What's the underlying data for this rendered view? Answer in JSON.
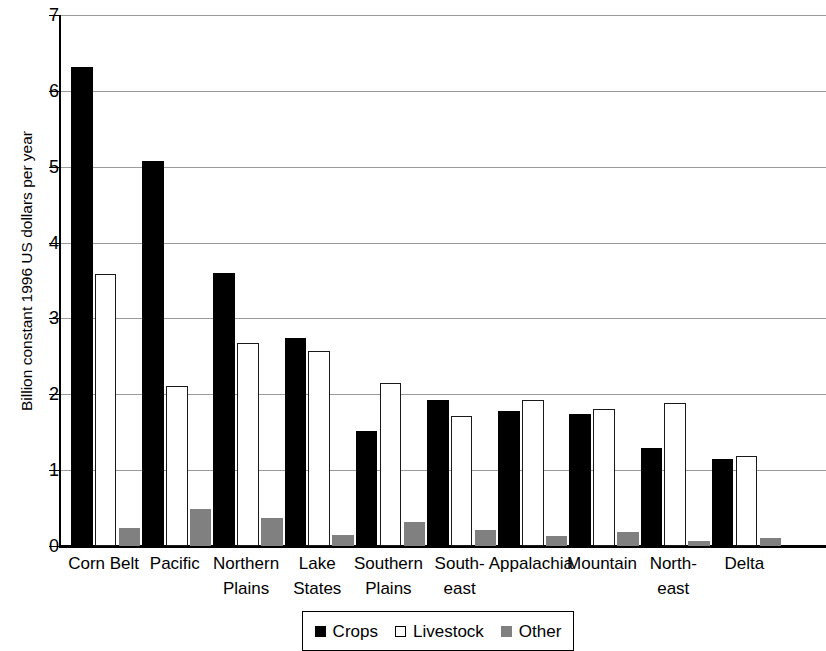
{
  "chart_data": {
    "type": "bar",
    "title": "",
    "xlabel": "",
    "ylabel": "Billion constant 1996 US dollars per year",
    "ylim": [
      0,
      7
    ],
    "yticks": [
      0,
      1,
      2,
      3,
      4,
      5,
      6,
      7
    ],
    "ytick_labels": [
      "0",
      "1",
      "2",
      "3",
      "4",
      "5",
      "6",
      "7"
    ],
    "grid": "horizontal",
    "legend_position": "bottom",
    "categories": [
      "Corn Belt",
      "Pacific",
      "Northern\nPlains",
      "Lake\nStates",
      "Southern\nPlains",
      "South-\neast",
      "Appalachia",
      "Mountain",
      "North-\neast",
      "Delta"
    ],
    "series": [
      {
        "name": "Crops",
        "color": "#000000",
        "values": [
          6.31,
          5.07,
          3.6,
          2.74,
          1.52,
          1.92,
          1.78,
          1.74,
          1.29,
          1.15
        ]
      },
      {
        "name": "Livestock",
        "color": "#ffffff",
        "values": [
          3.59,
          2.11,
          2.68,
          2.57,
          2.15,
          1.72,
          1.93,
          1.81,
          1.88,
          1.19
        ]
      },
      {
        "name": "Other",
        "color": "#808080",
        "values": [
          0.24,
          0.49,
          0.37,
          0.15,
          0.32,
          0.21,
          0.13,
          0.19,
          0.06,
          0.1
        ]
      }
    ]
  },
  "legend": {
    "entries": [
      {
        "label": "Crops",
        "swatch": "filled-black-square-icon"
      },
      {
        "label": "Livestock",
        "swatch": "outlined-white-square-icon"
      },
      {
        "label": "Other",
        "swatch": "filled-gray-square-icon"
      }
    ]
  }
}
